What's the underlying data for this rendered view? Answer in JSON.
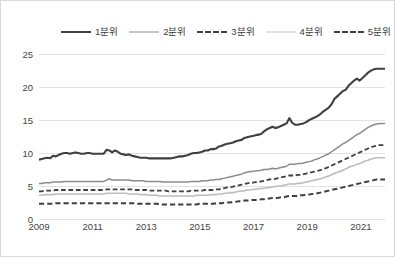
{
  "chart_data": {
    "type": "line",
    "title": "",
    "xlabel": "",
    "ylabel": "",
    "xlim": [
      2009,
      2021.9
    ],
    "ylim": [
      0,
      27
    ],
    "yticks": [
      0,
      5,
      10,
      15,
      20,
      25
    ],
    "xticks": [
      2009,
      2011,
      2013,
      2015,
      2017,
      2019,
      2021
    ],
    "grid": "horizontal",
    "legend_position": "top",
    "series": [
      {
        "name": "1분위",
        "color": "#3f3f3f",
        "style": "solid",
        "width": 2.1,
        "values": [
          9.0,
          9.1,
          9.2,
          9.3,
          9.2,
          9.6,
          9.5,
          9.7,
          9.9,
          10.0,
          10.0,
          9.9,
          10.0,
          10.1,
          10.0,
          9.9,
          9.9,
          10.0,
          10.0,
          9.9,
          9.9,
          9.9,
          9.9,
          9.9,
          10.5,
          10.4,
          10.1,
          10.4,
          10.2,
          9.9,
          9.8,
          9.7,
          9.8,
          9.6,
          9.5,
          9.4,
          9.3,
          9.3,
          9.3,
          9.2,
          9.2,
          9.2,
          9.2,
          9.2,
          9.2,
          9.2,
          9.2,
          9.2,
          9.3,
          9.4,
          9.5,
          9.5,
          9.6,
          9.7,
          9.9,
          10.0,
          10.0,
          10.1,
          10.2,
          10.4,
          10.4,
          10.6,
          10.6,
          10.7,
          11.0,
          11.1,
          11.3,
          11.4,
          11.5,
          11.6,
          11.8,
          11.9,
          12.0,
          12.3,
          12.4,
          12.5,
          12.6,
          12.7,
          12.8,
          12.9,
          13.3,
          13.6,
          13.8,
          14.0,
          13.8,
          13.9,
          14.1,
          14.3,
          14.5,
          15.3,
          14.6,
          14.3,
          14.3,
          14.4,
          14.5,
          14.7,
          15.0,
          15.2,
          15.4,
          15.6,
          15.9,
          16.3,
          16.6,
          16.9,
          17.4,
          18.2,
          18.6,
          19.0,
          19.4,
          19.6,
          20.2,
          20.6,
          21.0,
          21.3,
          21.0,
          21.4,
          21.8,
          22.2,
          22.5,
          22.7,
          22.8,
          22.8,
          22.8,
          22.8
        ]
      },
      {
        "name": "2분위",
        "color": "#8c8c8c",
        "style": "solid",
        "width": 1.5,
        "values": [
          5.4,
          5.4,
          5.5,
          5.5,
          5.5,
          5.6,
          5.6,
          5.6,
          5.6,
          5.7,
          5.7,
          5.7,
          5.7,
          5.7,
          5.7,
          5.7,
          5.7,
          5.7,
          5.7,
          5.7,
          5.7,
          5.7,
          5.7,
          5.7,
          5.9,
          6.1,
          5.9,
          5.9,
          5.9,
          5.9,
          5.9,
          5.9,
          5.9,
          5.8,
          5.8,
          5.8,
          5.8,
          5.8,
          5.7,
          5.7,
          5.7,
          5.7,
          5.7,
          5.7,
          5.6,
          5.6,
          5.6,
          5.6,
          5.6,
          5.6,
          5.6,
          5.6,
          5.6,
          5.6,
          5.7,
          5.7,
          5.7,
          5.7,
          5.8,
          5.8,
          5.8,
          5.9,
          5.9,
          6.0,
          6.0,
          6.1,
          6.2,
          6.3,
          6.4,
          6.5,
          6.6,
          6.7,
          6.8,
          7.0,
          7.1,
          7.2,
          7.2,
          7.3,
          7.3,
          7.4,
          7.5,
          7.5,
          7.6,
          7.7,
          7.6,
          7.7,
          7.8,
          7.9,
          8.0,
          8.3,
          8.3,
          8.3,
          8.4,
          8.4,
          8.5,
          8.6,
          8.7,
          8.8,
          9.0,
          9.1,
          9.3,
          9.5,
          9.7,
          9.9,
          10.2,
          10.5,
          10.8,
          11.1,
          11.4,
          11.6,
          11.9,
          12.2,
          12.5,
          12.8,
          13.0,
          13.3,
          13.6,
          13.9,
          14.1,
          14.3,
          14.4,
          14.5,
          14.5,
          14.5
        ]
      },
      {
        "name": "3분위",
        "color": "#3f3f3f",
        "style": "dashed",
        "width": 1.8,
        "values": [
          4.2,
          4.2,
          4.3,
          4.3,
          4.3,
          4.3,
          4.4,
          4.4,
          4.4,
          4.4,
          4.4,
          4.4,
          4.4,
          4.4,
          4.4,
          4.4,
          4.4,
          4.4,
          4.4,
          4.4,
          4.4,
          4.4,
          4.4,
          4.4,
          4.5,
          4.5,
          4.5,
          4.5,
          4.5,
          4.5,
          4.5,
          4.5,
          4.5,
          4.5,
          4.4,
          4.4,
          4.4,
          4.4,
          4.4,
          4.3,
          4.3,
          4.3,
          4.3,
          4.3,
          4.3,
          4.3,
          4.2,
          4.2,
          4.2,
          4.2,
          4.2,
          4.2,
          4.2,
          4.2,
          4.3,
          4.3,
          4.3,
          4.3,
          4.3,
          4.4,
          4.4,
          4.4,
          4.4,
          4.5,
          4.5,
          4.6,
          4.7,
          4.8,
          4.8,
          4.9,
          5.0,
          5.1,
          5.2,
          5.3,
          5.4,
          5.5,
          5.5,
          5.6,
          5.6,
          5.7,
          5.8,
          5.9,
          6.0,
          6.1,
          6.1,
          6.2,
          6.3,
          6.4,
          6.5,
          6.6,
          6.6,
          6.6,
          6.7,
          6.7,
          6.8,
          6.9,
          7.0,
          7.1,
          7.2,
          7.3,
          7.4,
          7.6,
          7.7,
          7.9,
          8.1,
          8.3,
          8.5,
          8.7,
          8.9,
          9.1,
          9.3,
          9.5,
          9.7,
          9.9,
          10.1,
          10.3,
          10.5,
          10.7,
          10.9,
          11.0,
          11.1,
          11.2,
          11.2,
          11.2
        ]
      },
      {
        "name": "4분위",
        "color": "#bdbdbd",
        "style": "solid",
        "width": 1.6,
        "values": [
          3.6,
          3.6,
          3.7,
          3.7,
          3.7,
          3.7,
          3.8,
          3.8,
          3.8,
          3.8,
          3.8,
          3.8,
          3.8,
          3.8,
          3.8,
          3.8,
          3.8,
          3.8,
          3.8,
          3.8,
          3.8,
          3.8,
          3.8,
          3.8,
          3.9,
          3.9,
          3.9,
          3.9,
          3.9,
          3.9,
          3.9,
          3.9,
          3.8,
          3.8,
          3.8,
          3.8,
          3.7,
          3.7,
          3.7,
          3.6,
          3.6,
          3.6,
          3.6,
          3.5,
          3.5,
          3.5,
          3.5,
          3.5,
          3.5,
          3.5,
          3.5,
          3.5,
          3.5,
          3.5,
          3.5,
          3.5,
          3.6,
          3.6,
          3.6,
          3.6,
          3.6,
          3.7,
          3.7,
          3.7,
          3.8,
          3.8,
          3.9,
          3.9,
          4.0,
          4.0,
          4.1,
          4.2,
          4.2,
          4.3,
          4.4,
          4.4,
          4.5,
          4.5,
          4.6,
          4.6,
          4.7,
          4.7,
          4.8,
          4.9,
          4.9,
          5.0,
          5.0,
          5.1,
          5.2,
          5.3,
          5.3,
          5.3,
          5.4,
          5.4,
          5.5,
          5.6,
          5.7,
          5.8,
          5.9,
          6.0,
          6.1,
          6.2,
          6.4,
          6.5,
          6.7,
          6.9,
          7.1,
          7.2,
          7.4,
          7.6,
          7.8,
          8.0,
          8.1,
          8.3,
          8.4,
          8.6,
          8.8,
          8.9,
          9.1,
          9.2,
          9.3,
          9.3,
          9.3,
          9.3
        ]
      },
      {
        "name": "5분위",
        "color": "#3f3f3f",
        "style": "dashed",
        "width": 2.0,
        "values": [
          2.3,
          2.3,
          2.3,
          2.3,
          2.3,
          2.3,
          2.4,
          2.4,
          2.4,
          2.4,
          2.4,
          2.4,
          2.4,
          2.4,
          2.4,
          2.4,
          2.4,
          2.4,
          2.4,
          2.4,
          2.4,
          2.4,
          2.4,
          2.4,
          2.4,
          2.4,
          2.4,
          2.4,
          2.4,
          2.4,
          2.4,
          2.4,
          2.4,
          2.4,
          2.4,
          2.3,
          2.3,
          2.3,
          2.3,
          2.3,
          2.3,
          2.3,
          2.3,
          2.2,
          2.2,
          2.2,
          2.2,
          2.2,
          2.2,
          2.2,
          2.2,
          2.2,
          2.2,
          2.2,
          2.2,
          2.2,
          2.2,
          2.3,
          2.3,
          2.3,
          2.3,
          2.3,
          2.3,
          2.4,
          2.4,
          2.4,
          2.5,
          2.5,
          2.5,
          2.6,
          2.6,
          2.7,
          2.7,
          2.8,
          2.8,
          2.8,
          2.9,
          2.9,
          2.9,
          3.0,
          3.0,
          3.1,
          3.1,
          3.2,
          3.2,
          3.2,
          3.3,
          3.3,
          3.4,
          3.5,
          3.5,
          3.5,
          3.5,
          3.6,
          3.6,
          3.7,
          3.7,
          3.8,
          3.8,
          3.9,
          4.0,
          4.1,
          4.2,
          4.3,
          4.4,
          4.5,
          4.6,
          4.7,
          4.8,
          4.9,
          5.0,
          5.1,
          5.2,
          5.3,
          5.4,
          5.5,
          5.6,
          5.7,
          5.8,
          5.9,
          6.0,
          6.0,
          6.0,
          6.0
        ]
      }
    ]
  },
  "legend": {
    "items": [
      {
        "label": "1분위"
      },
      {
        "label": "2분위"
      },
      {
        "label": "3분위"
      },
      {
        "label": "4분위"
      },
      {
        "label": "5분위"
      }
    ]
  },
  "axes": {
    "y_tick_labels": [
      "0",
      "5",
      "10",
      "15",
      "20",
      "25"
    ],
    "x_tick_labels": [
      "2009",
      "2011",
      "2013",
      "2015",
      "2017",
      "2019",
      "2021"
    ]
  }
}
